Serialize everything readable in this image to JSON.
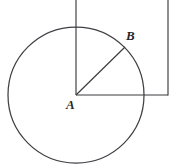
{
  "figure": {
    "type": "geometry-diagram",
    "width": 173,
    "height": 166,
    "background_color": "#ffffff",
    "stroke_color": "#3b3b3f",
    "label_color": "#262628",
    "labels": {
      "center": "A",
      "point_on_circle": "B"
    },
    "geometry": {
      "circle": {
        "center_x": 76,
        "center_y": 95,
        "radius": 68
      },
      "vertical_line_through_center": {
        "x": 76,
        "y_start": 0,
        "y_end": 95
      },
      "horizontal_line_from_center": {
        "y": 95,
        "x_start": 76,
        "x_end": 168
      },
      "right_vertical_line": {
        "x": 168,
        "y_start": 0,
        "y_end": 95
      },
      "radius_segment_AB": {
        "x1": 76,
        "y1": 95,
        "x2": 125,
        "y2": 47
      }
    }
  }
}
